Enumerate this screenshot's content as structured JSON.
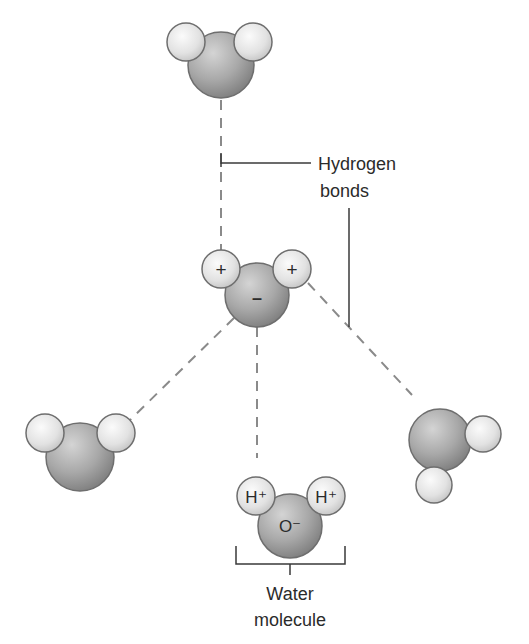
{
  "diagram": {
    "title_labels": {
      "hydrogen_bonds_line1": "Hydrogen",
      "hydrogen_bonds_line2": "bonds",
      "water_molecule_line1": "Water",
      "water_molecule_line2": "molecule"
    },
    "central_molecule": {
      "oxygen_charge": "–",
      "hydrogen_left_charge": "+",
      "hydrogen_right_charge": "+"
    },
    "labeled_molecule": {
      "hydrogen_left": "H⁺",
      "hydrogen_right": "H⁺",
      "oxygen": "O⁻"
    },
    "colors": {
      "oxygen_fill": "#9a9a9a",
      "hydrogen_fill": "#dcdcdc",
      "outline": "#6e6e6e",
      "dashed_bond": "#8a8a8a",
      "leader_line": "#3a3a3a",
      "text": "#2b2b2b"
    }
  }
}
